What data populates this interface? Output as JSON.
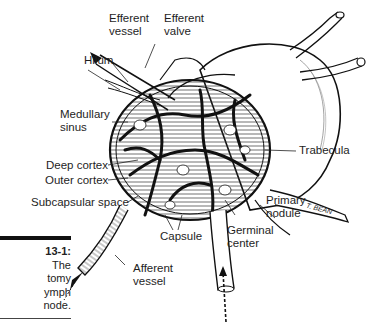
{
  "figure": {
    "caption": {
      "number": "13-1:",
      "lines": [
        "The",
        "tomy",
        "ymph",
        "node."
      ]
    }
  },
  "labels": {
    "efferent_vessel": [
      "Efferent",
      "vessel"
    ],
    "efferent_valve": [
      "Efferent",
      "valve"
    ],
    "hilum": "Hilum",
    "medullary_sinus": [
      "Medullary",
      "sinus"
    ],
    "deep_cortex": "Deep cortex",
    "outer_cortex": "Outer cortex",
    "subcapsular_space": "Subcapsular space",
    "trabecula": "Trabecula",
    "primary_nodule": [
      "Primary",
      "nodule"
    ],
    "capsule": "Capsule",
    "germinal_center": [
      "Germinal",
      "center"
    ],
    "afferent_vessel": [
      "Afferent",
      "vessel"
    ],
    "artist_signature": "T. BEAN"
  },
  "colors": {
    "ink": "#111111",
    "background": "#ffffff"
  }
}
